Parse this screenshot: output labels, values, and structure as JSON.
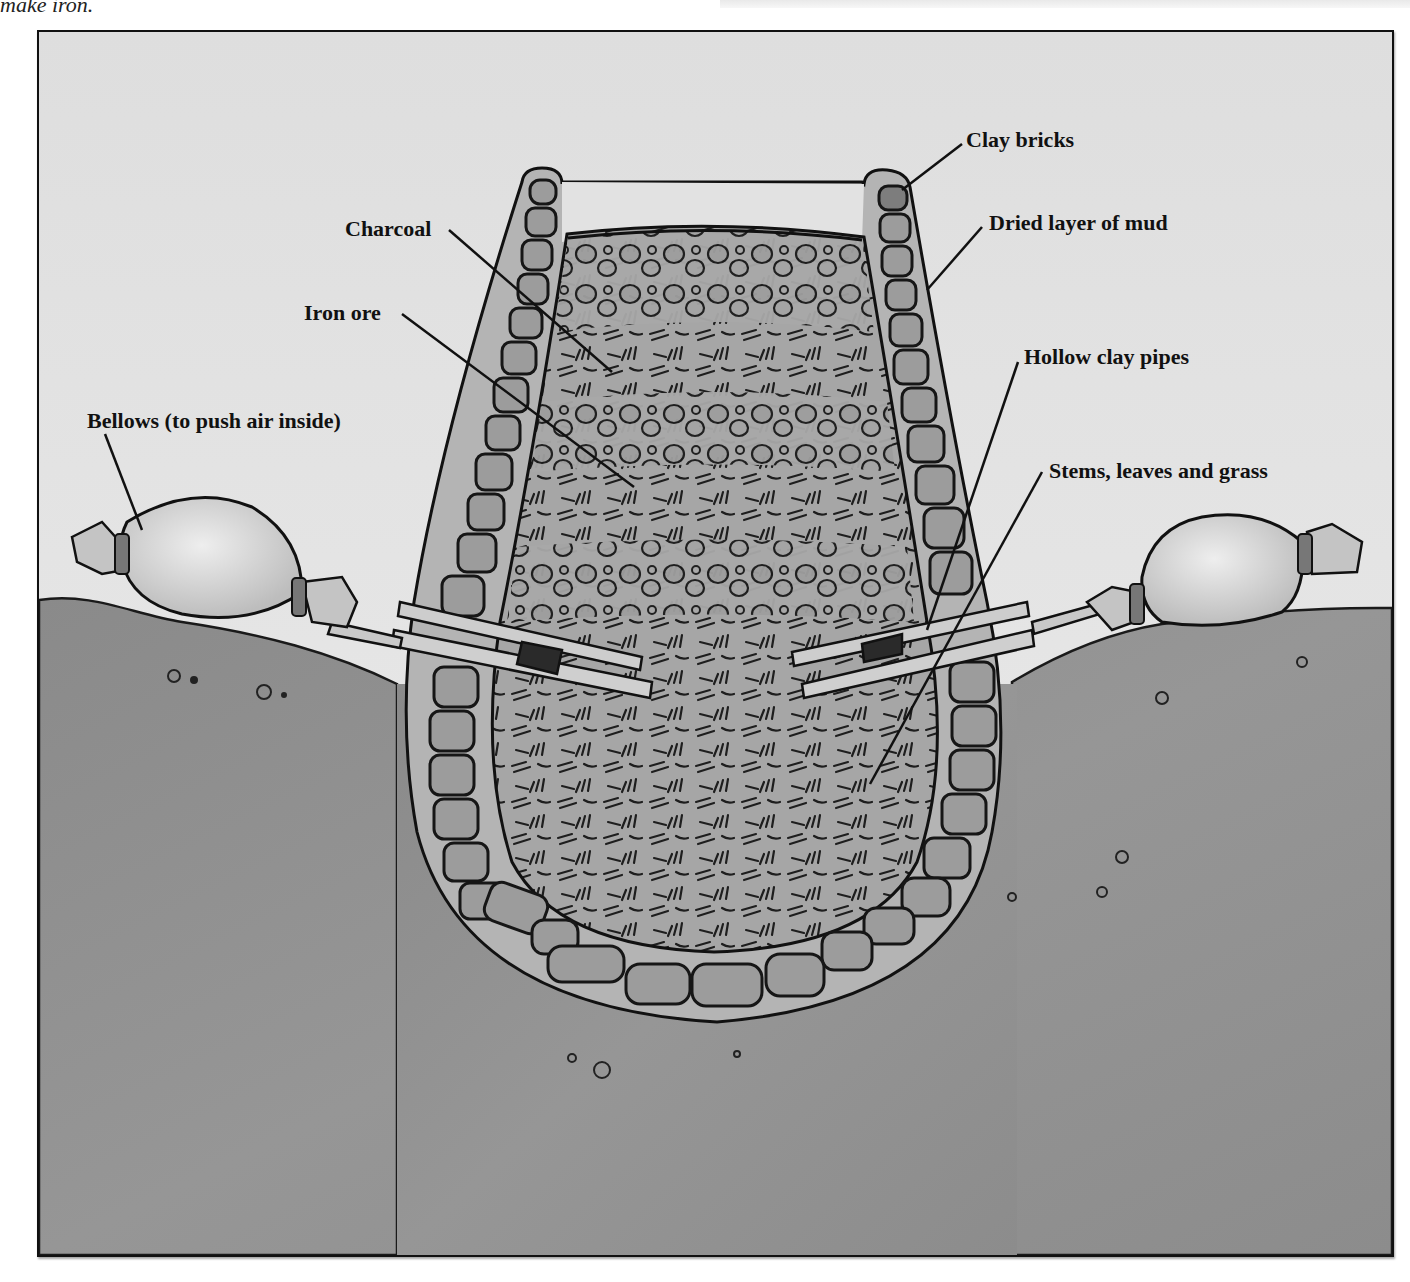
{
  "caption_fragment": "make iron.",
  "figure": {
    "labels": [
      {
        "id": "clay-bricks",
        "text": "Clay bricks"
      },
      {
        "id": "dried-mud",
        "text": "Dried layer of mud"
      },
      {
        "id": "charcoal",
        "text": "Charcoal"
      },
      {
        "id": "iron-ore",
        "text": "Iron ore"
      },
      {
        "id": "hollow-pipes",
        "text": "Hollow clay pipes"
      },
      {
        "id": "bellows",
        "text": "Bellows (to push air inside)"
      },
      {
        "id": "stems",
        "text": "Stems, leaves and grass"
      }
    ]
  },
  "colors": {
    "sky": "#e6e6e6",
    "ground": "#8f8f8f",
    "mud_layer": "#b5b5b5",
    "brick": "#9a9a9a",
    "fill": "#a9a9a9",
    "bellows": "#d9d9d9",
    "pipe": "#cfcfcf",
    "ink": "#111111"
  }
}
